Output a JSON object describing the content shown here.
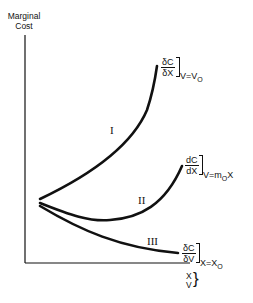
{
  "diagram": {
    "y_axis_label_line1": "Marginal",
    "y_axis_label_line2": "Cost",
    "x_axis_label_line1": "X",
    "x_axis_label_line2": "V",
    "x_axis_brace": "}",
    "curves": [
      {
        "id": "I",
        "roman_label": "I",
        "frac_num": "δC",
        "frac_den": "δX",
        "condition": "V=V",
        "condition_sub": "O",
        "shape": "rising convex"
      },
      {
        "id": "II",
        "roman_label": "II",
        "frac_num": "dC",
        "frac_den": "dX",
        "condition": "V=m",
        "condition_sub": "O",
        "condition_tail": "X",
        "shape": "U-shaped"
      },
      {
        "id": "III",
        "roman_label": "III",
        "frac_num": "δC",
        "frac_den": "δV",
        "condition": "X=X",
        "condition_sub": "O",
        "shape": "falling"
      }
    ],
    "line_color": "#111111",
    "background": "#ffffff"
  }
}
